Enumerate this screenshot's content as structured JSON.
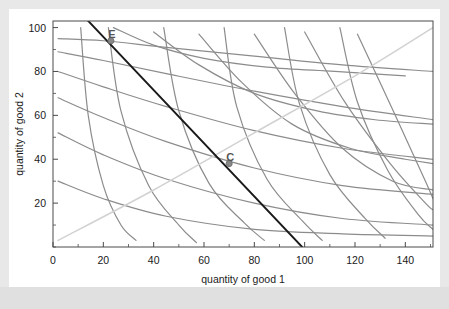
{
  "chart_data": {
    "type": "line",
    "title": "",
    "xlabel": "quantity of good 1",
    "ylabel": "quantity of good 2",
    "xlim": [
      0,
      151
    ],
    "ylim": [
      0,
      103
    ],
    "xticks": [
      0,
      20,
      40,
      60,
      80,
      100,
      120,
      140
    ],
    "yticks": [
      20,
      40,
      60,
      80,
      100
    ],
    "xtick_labels": [
      "0",
      "20",
      "40",
      "60",
      "80",
      "100",
      "120",
      "140"
    ],
    "ytick_labels": [
      "20",
      "40",
      "60",
      "80",
      "100"
    ],
    "grid": false,
    "legend": null,
    "annotations": [
      {
        "label": "E",
        "x": 23,
        "y": 94
      },
      {
        "label": "C",
        "x": 70,
        "y": 38
      }
    ],
    "points": [
      {
        "name": "E",
        "x": 23,
        "y": 94
      },
      {
        "name": "C",
        "x": 70,
        "y": 38
      }
    ],
    "series": [
      {
        "name": "budget-line",
        "kind": "straight",
        "color": "#1a1a1a",
        "width": 1.9,
        "x": [
          0,
          23,
          70,
          99
        ],
        "values": [
          120,
          94,
          38,
          0
        ]
      },
      {
        "name": "offer-curve",
        "kind": "light-diagonal",
        "color": "#d2d2d2",
        "width": 1.6,
        "x": [
          2,
          40,
          80,
          120,
          151
        ],
        "values": [
          3,
          26,
          52,
          78,
          100
        ]
      },
      {
        "name": "indifference-A-1",
        "kind": "consumer-a",
        "color": "#8c8c8c",
        "width": 1.2,
        "x": [
          2,
          20,
          45,
          80,
          115,
          151
        ],
        "values": [
          95,
          94,
          91,
          87,
          83,
          80
        ]
      },
      {
        "name": "indifference-A-2",
        "kind": "consumer-a",
        "color": "#8c8c8c",
        "width": 1.2,
        "x": [
          2,
          20,
          45,
          80,
          115,
          151
        ],
        "values": [
          89,
          85,
          79,
          71,
          64,
          58
        ]
      },
      {
        "name": "indifference-A-3",
        "kind": "consumer-a",
        "color": "#8c8c8c",
        "width": 1.2,
        "x": [
          2,
          20,
          45,
          80,
          115,
          151
        ],
        "values": [
          80,
          73,
          64,
          53,
          45,
          40
        ]
      },
      {
        "name": "indifference-A-4",
        "kind": "consumer-a",
        "color": "#8c8c8c",
        "width": 1.2,
        "x": [
          2,
          20,
          45,
          80,
          115,
          151
        ],
        "values": [
          68,
          59,
          48,
          36,
          28,
          24
        ]
      },
      {
        "name": "indifference-A-5",
        "kind": "consumer-a",
        "color": "#8c8c8c",
        "width": 1.2,
        "x": [
          2,
          20,
          45,
          80,
          115,
          151
        ],
        "values": [
          52,
          42,
          31,
          20,
          13,
          10
        ]
      },
      {
        "name": "indifference-A-6",
        "kind": "consumer-a",
        "color": "#8c8c8c",
        "width": 1.2,
        "x": [
          2,
          20,
          45,
          80,
          115,
          151
        ],
        "values": [
          30,
          22,
          14,
          8,
          6,
          5
        ]
      },
      {
        "name": "indifference-B-1",
        "kind": "consumer-b",
        "color": "#8c8c8c",
        "width": 1.2,
        "x": [
          11,
          14,
          20,
          27,
          33
        ],
        "values": [
          100,
          60,
          28,
          10,
          3
        ]
      },
      {
        "name": "indifference-B-2",
        "kind": "consumer-b",
        "color": "#8c8c8c",
        "width": 1.2,
        "x": [
          22,
          27,
          38,
          50,
          57
        ],
        "values": [
          100,
          62,
          28,
          10,
          2
        ]
      },
      {
        "name": "indifference-B-3",
        "kind": "consumer-b",
        "color": "#8c8c8c",
        "width": 1.2,
        "x": [
          44,
          50,
          62,
          76,
          84
        ],
        "values": [
          100,
          62,
          29,
          11,
          3
        ]
      },
      {
        "name": "indifference-B-4",
        "kind": "consumer-b",
        "color": "#8c8c8c",
        "width": 1.2,
        "x": [
          68,
          73,
          85,
          99,
          107
        ],
        "values": [
          100,
          64,
          31,
          12,
          3
        ]
      },
      {
        "name": "indifference-B-5",
        "kind": "consumer-b",
        "color": "#8c8c8c",
        "width": 1.2,
        "x": [
          92,
          98,
          110,
          124,
          132
        ],
        "values": [
          100,
          65,
          33,
          13,
          4
        ]
      },
      {
        "name": "indifference-B-6",
        "kind": "consumer-b",
        "color": "#8c8c8c",
        "width": 1.2,
        "x": [
          114,
          121,
          133,
          145,
          151
        ],
        "values": [
          100,
          66,
          35,
          15,
          8
        ]
      },
      {
        "name": "indifference-C-1",
        "kind": "bowed",
        "color": "#8c8c8c",
        "width": 1.2,
        "x": [
          24,
          40,
          60,
          85,
          112,
          140
        ],
        "values": [
          100,
          92,
          86,
          82,
          80,
          78
        ]
      },
      {
        "name": "indifference-C-2",
        "kind": "bowed",
        "color": "#8c8c8c",
        "width": 1.2,
        "x": [
          40,
          58,
          80,
          105,
          128,
          151
        ],
        "values": [
          98,
          83,
          70,
          62,
          58,
          56
        ]
      },
      {
        "name": "indifference-C-3",
        "kind": "bowed",
        "color": "#8c8c8c",
        "width": 1.2,
        "x": [
          58,
          75,
          95,
          118,
          140,
          151
        ],
        "values": [
          97,
          75,
          56,
          45,
          40,
          38
        ]
      },
      {
        "name": "indifference-C-4",
        "kind": "bowed",
        "color": "#8c8c8c",
        "width": 1.2,
        "x": [
          80,
          96,
          115,
          135,
          151
        ],
        "values": [
          97,
          70,
          45,
          30,
          26
        ]
      },
      {
        "name": "indifference-C-5",
        "kind": "bowed",
        "color": "#8c8c8c",
        "width": 1.2,
        "x": [
          100,
          116,
          134,
          148,
          151
        ],
        "values": [
          98,
          66,
          38,
          20,
          17
        ]
      },
      {
        "name": "indifference-C-6",
        "kind": "bowed",
        "color": "#8c8c8c",
        "width": 1.2,
        "x": [
          121,
          136,
          148,
          151
        ],
        "values": [
          97,
          60,
          30,
          22
        ]
      }
    ]
  },
  "axes": {
    "xlabel": "quantity of good 1",
    "ylabel": "quantity of good 2"
  },
  "colors": {
    "frame": "#4a4a4a",
    "curve": "#8c8c8c",
    "budget": "#1a1a1a",
    "offer": "#d2d2d2",
    "marker": "#777777",
    "background": "#ffffff",
    "outer": "#e8e8e8"
  }
}
